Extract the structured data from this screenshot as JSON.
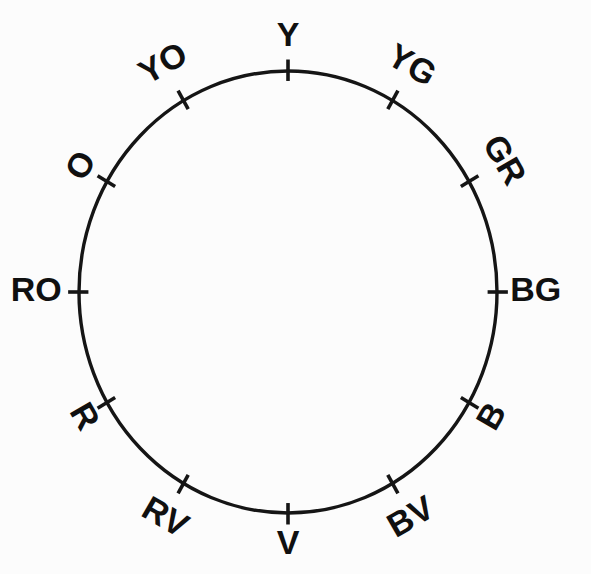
{
  "figure": {
    "name": "color-wheel",
    "background_color": "#fcfcfc",
    "stroke_color": "#151515",
    "geometry": {
      "center_x": 288,
      "center_y": 292,
      "radius_x": 209,
      "radius_y": 221,
      "tick_inner": 0.955,
      "tick_outer": 1.052
    }
  },
  "chart_data": {
    "type": "pie",
    "xlabel": "",
    "ylabel": "",
    "legend": "none",
    "grid": false,
    "categories": [
      "Y",
      "YG",
      "GR",
      "BG",
      "B",
      "BV",
      "V",
      "RV",
      "R",
      "RO",
      "O",
      "YO"
    ],
    "values": [
      30,
      30,
      30,
      30,
      30,
      30,
      30,
      30,
      30,
      30,
      30,
      30
    ],
    "angles_deg": [
      0,
      30,
      60,
      90,
      120,
      150,
      180,
      210,
      240,
      270,
      300,
      330
    ],
    "annotations": [
      "Y at 12 o'clock",
      "V at 6 o'clock",
      "BG at 3 o'clock",
      "RO at 9 o'clock"
    ]
  },
  "labels": [
    {
      "id": "y",
      "text": "Y",
      "angle": 0,
      "rotation": 0,
      "label_radius": 1.155
    },
    {
      "id": "yg",
      "text": "YG",
      "angle": 30,
      "rotation": 30,
      "label_radius": 1.175
    },
    {
      "id": "gr",
      "text": "GR",
      "angle": 60,
      "rotation": 60,
      "label_radius": 1.185
    },
    {
      "id": "bg",
      "text": "BG",
      "angle": 90,
      "rotation": 0,
      "label_radius": 1.185
    },
    {
      "id": "b",
      "text": "B",
      "angle": 120,
      "rotation": -60,
      "label_radius": 1.135
    },
    {
      "id": "bv",
      "text": "BV",
      "angle": 150,
      "rotation": -30,
      "label_radius": 1.185
    },
    {
      "id": "v",
      "text": "V",
      "angle": 180,
      "rotation": 0,
      "label_radius": 1.145
    },
    {
      "id": "rv",
      "text": "RV",
      "angle": 210,
      "rotation": 30,
      "label_radius": 1.185
    },
    {
      "id": "r",
      "text": "R",
      "angle": 240,
      "rotation": 60,
      "label_radius": 1.135
    },
    {
      "id": "ro",
      "text": "RO",
      "angle": 270,
      "rotation": 0,
      "label_radius": 1.205
    },
    {
      "id": "o",
      "text": "O",
      "angle": 300,
      "rotation": -60,
      "label_radius": 1.135
    },
    {
      "id": "yo",
      "text": "YO",
      "angle": 330,
      "rotation": -30,
      "label_radius": 1.185
    }
  ]
}
